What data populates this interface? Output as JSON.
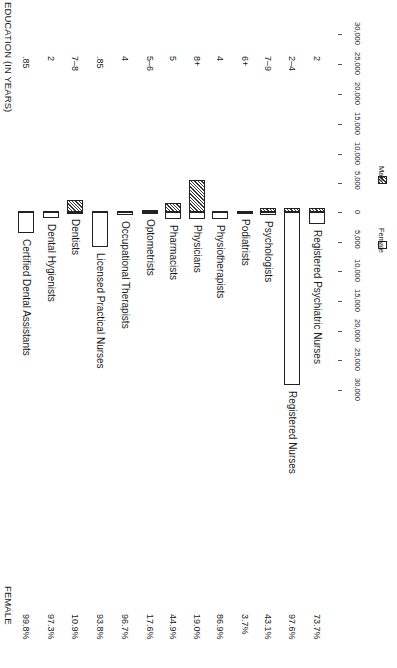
{
  "headers": {
    "education": "EDUCATION (IN YEARS)",
    "female": "FEMALE"
  },
  "legend": {
    "female": "Female",
    "male": "Male"
  },
  "axis": {
    "tick_labels_male": [
      "30,000",
      "25,000",
      "20,000",
      "15,000",
      "10,000",
      "5,000"
    ],
    "zero_label": "0",
    "tick_labels_female": [
      "5,000",
      "10,000",
      "15,000",
      "20,000",
      "25,000",
      "30,000"
    ]
  },
  "colors": {
    "ink": "#1a1a1a",
    "background": "#ffffff"
  },
  "categories": [
    {
      "name": "Certified Dental Assistants",
      "education": ".85",
      "female_pct": "99.8%"
    },
    {
      "name": "Dental Hygienists",
      "education": "2",
      "female_pct": "97.3%"
    },
    {
      "name": "Dentists",
      "education": "7–8",
      "female_pct": "10.9%"
    },
    {
      "name": "Licensed Practical Nurses",
      "education": ".85",
      "female_pct": "93.8%"
    },
    {
      "name": "Occupational Therapists",
      "education": "4",
      "female_pct": "96.7%"
    },
    {
      "name": "Optometrists",
      "education": "5–6",
      "female_pct": "17.6%"
    },
    {
      "name": "Pharmacists",
      "education": "5",
      "female_pct": "44.9%"
    },
    {
      "name": "Physicians",
      "education": "8+",
      "female_pct": "19.0%"
    },
    {
      "name": "Physiotherapists",
      "education": "4",
      "female_pct": "86.9%"
    },
    {
      "name": "Podiatrists",
      "education": "6+",
      "female_pct": "3.7%"
    },
    {
      "name": "Psychologists",
      "education": "7–9",
      "female_pct": "43.1%"
    },
    {
      "name": "Registered Nurses",
      "education": "2–4",
      "female_pct": "97.6%"
    },
    {
      "name": "Registered Psychiatric Nurses",
      "education": "2",
      "female_pct": "73.7%"
    }
  ],
  "chart_data": {
    "type": "bar",
    "orientation": "diverging (rotated 90°)",
    "title": "",
    "categories": [
      "Certified Dental Assistants",
      "Dental Hygienists",
      "Dentists",
      "Licensed Practical Nurses",
      "Occupational Therapists",
      "Optometrists",
      "Pharmacists",
      "Physicians",
      "Physiotherapists",
      "Podiatrists",
      "Psychologists",
      "Registered Nurses",
      "Registered Psychiatric Nurses"
    ],
    "series": [
      {
        "name": "Female",
        "values": [
          3500,
          1000,
          200,
          5900,
          500,
          50,
          1200,
          1200,
          1200,
          50,
          500,
          29000,
          2100
        ]
      },
      {
        "name": "Male",
        "values": [
          10,
          30,
          2000,
          200,
          20,
          300,
          1500,
          5300,
          180,
          50,
          700,
          700,
          700
        ]
      }
    ],
    "female_percent": [
      99.8,
      97.3,
      10.9,
      93.8,
      96.7,
      17.6,
      44.9,
      19.0,
      86.9,
      3.7,
      43.1,
      97.6,
      73.7
    ],
    "education_years": [
      ".85",
      "2",
      "7–8",
      ".85",
      "4",
      "5–6",
      "5",
      "8+",
      "4",
      "6+",
      "7–9",
      "2–4",
      "2"
    ],
    "xlabel": "",
    "ylabel": "Number of practitioners",
    "ylim_male": [
      0,
      30000
    ],
    "ylim_female": [
      0,
      30000
    ],
    "ticks": [
      0,
      5000,
      10000,
      15000,
      20000,
      25000,
      30000
    ],
    "legend_position": "right, near zero line",
    "grid": false
  }
}
